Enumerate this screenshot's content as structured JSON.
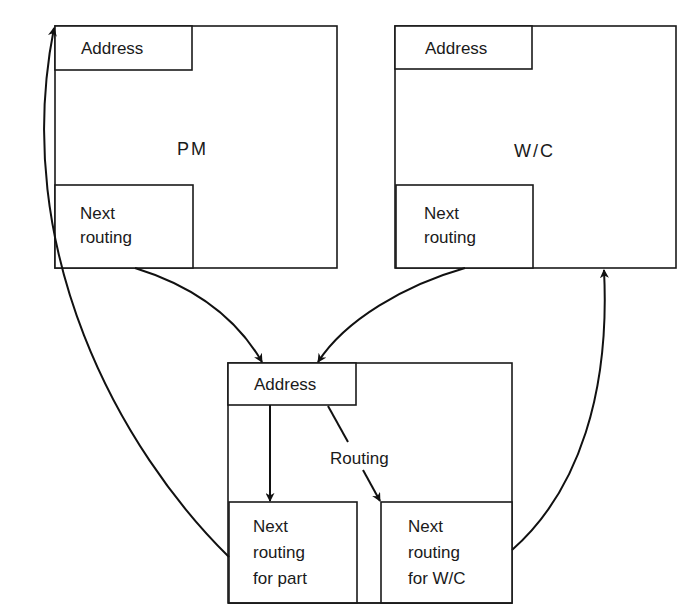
{
  "diagram": {
    "records": [
      {
        "id": "pm",
        "title": "PM",
        "address_label": "Address",
        "next_routing_label": [
          "Next",
          "routing"
        ]
      },
      {
        "id": "wc",
        "title": "W/C",
        "address_label": "Address",
        "next_routing_label": [
          "Next",
          "routing"
        ]
      },
      {
        "id": "routing",
        "address_label": "Address",
        "routing_label": "Routing",
        "next_routing_part_label": [
          "Next",
          "routing",
          "for part"
        ],
        "next_routing_wc_label": [
          "Next",
          "routing",
          "for W/C"
        ]
      }
    ],
    "connections": [
      {
        "from": "PM next routing",
        "to": "Routing address"
      },
      {
        "from": "W/C next routing",
        "to": "Routing address"
      },
      {
        "from": "Routing address",
        "to": "Next routing for part"
      },
      {
        "from": "Routing address",
        "to": "Next routing for W/C"
      },
      {
        "from": "Next routing for part",
        "to": "PM address"
      },
      {
        "from": "Next routing for W/C",
        "to": "W/C record"
      }
    ],
    "colors": {
      "line": "#111111",
      "background": "#ffffff"
    }
  }
}
